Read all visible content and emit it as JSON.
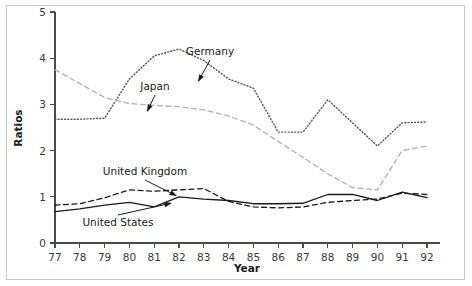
{
  "chart_data": {
    "type": "line",
    "title": "",
    "xlabel": "Year",
    "ylabel": "Ratios",
    "xlim": [
      77,
      92
    ],
    "ylim": [
      0,
      5
    ],
    "xticks": [
      "77",
      "78",
      "79",
      "80",
      "81",
      "82",
      "83",
      "84",
      "85",
      "86",
      "87",
      "88",
      "89",
      "90",
      "91",
      "92"
    ],
    "yticks": [
      "0",
      "1",
      "2",
      "3",
      "4",
      "5"
    ],
    "grid": false,
    "legend": "inline-annotations",
    "x": [
      77,
      78,
      79,
      80,
      81,
      82,
      83,
      84,
      85,
      86,
      87,
      88,
      89,
      90,
      91,
      92
    ],
    "series": [
      {
        "name": "Germany",
        "style": "dotted",
        "color": "#555555",
        "values": [
          2.68,
          2.68,
          2.7,
          3.55,
          4.05,
          4.2,
          3.95,
          3.55,
          3.35,
          2.4,
          2.4,
          3.1,
          2.6,
          2.1,
          2.6,
          2.62
        ]
      },
      {
        "name": "Japan",
        "style": "dashed",
        "color": "#b0b0b0",
        "values": [
          3.75,
          3.45,
          3.15,
          3.02,
          2.98,
          2.95,
          2.88,
          2.75,
          2.55,
          2.2,
          1.85,
          1.5,
          1.2,
          1.15,
          2.0,
          2.1
        ]
      },
      {
        "name": "United Kingdom",
        "style": "dashed",
        "color": "#1a1a1a",
        "values": [
          0.82,
          0.85,
          0.98,
          1.15,
          1.12,
          1.15,
          1.18,
          0.9,
          0.78,
          0.76,
          0.78,
          0.88,
          0.92,
          0.95,
          1.08,
          1.05
        ]
      },
      {
        "name": "United States",
        "style": "solid",
        "color": "#1a1a1a",
        "values": [
          0.68,
          0.74,
          0.82,
          0.88,
          0.78,
          1.0,
          0.95,
          0.92,
          0.85,
          0.85,
          0.86,
          1.05,
          1.05,
          0.92,
          1.1,
          0.98
        ]
      }
    ],
    "annotations": [
      {
        "name": "Germany",
        "label_x": 210,
        "label_y": 55,
        "tip_x": 198,
        "tip_y": 82
      },
      {
        "name": "Japan",
        "label_x": 155,
        "label_y": 90,
        "tip_x": 147,
        "tip_y": 112
      },
      {
        "name": "United Kingdom",
        "label_x": 145,
        "label_y": 175,
        "tip_x": 177,
        "tip_y": 196
      },
      {
        "name": "United States",
        "label_x": 118,
        "label_y": 226,
        "tip_x": 172,
        "tip_y": 203
      }
    ]
  }
}
